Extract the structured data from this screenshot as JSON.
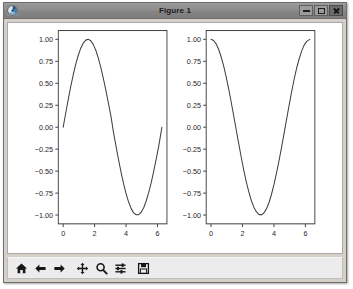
{
  "window": {
    "title": "Figure 1",
    "icon": "matplotlib-logo-icon",
    "buttons": {
      "minimize_label": "–",
      "maximize_label": "□",
      "close_label": "×",
      "minimize_name": "minimize",
      "maximize_name": "maximize",
      "close_name": "close"
    },
    "frame_color": "#d4d0c8",
    "titlebar_color": "#8a8a8a",
    "canvas_color": "#ffffff"
  },
  "toolbar": {
    "items": [
      {
        "name": "home-icon",
        "tooltip": "Reset original view"
      },
      {
        "name": "arrow-left-icon",
        "tooltip": "Back to previous view"
      },
      {
        "name": "arrow-right-icon",
        "tooltip": "Forward to next view"
      },
      {
        "name": "move-icon",
        "tooltip": "Pan axes with left mouse, zoom with right"
      },
      {
        "name": "magnifier-icon",
        "tooltip": "Zoom to rectangle"
      },
      {
        "name": "sliders-icon",
        "tooltip": "Configure subplots"
      },
      {
        "name": "floppy-disk-icon",
        "tooltip": "Save the figure"
      }
    ]
  },
  "chart_data": [
    {
      "type": "line",
      "title": "",
      "xlabel": "",
      "ylabel": "",
      "xlim": [
        -0.31,
        6.6
      ],
      "ylim": [
        -1.1,
        1.1
      ],
      "xticks": [
        0,
        2,
        4,
        6
      ],
      "xticklabels": [
        "0",
        "2",
        "4",
        "6"
      ],
      "yticks": [
        -1.0,
        -0.75,
        -0.5,
        -0.25,
        0.0,
        0.25,
        0.5,
        0.75,
        1.0
      ],
      "yticklabels": [
        "−1.00",
        "−0.75",
        "−0.50",
        "−0.25",
        "0.00",
        "0.25",
        "0.50",
        "0.75",
        "1.00"
      ],
      "grid": false,
      "legend": null,
      "series": [
        {
          "name": "sin(x)",
          "color": "#3b3b3b",
          "linewidth": 1.0,
          "x": [
            0.0,
            0.16,
            0.32,
            0.48,
            0.64,
            0.8,
            0.96,
            1.12,
            1.28,
            1.44,
            1.6,
            1.76,
            1.92,
            2.08,
            2.24,
            2.4,
            2.56,
            2.72,
            2.88,
            3.04,
            3.2,
            3.36,
            3.52,
            3.68,
            3.84,
            4.0,
            4.16,
            4.32,
            4.48,
            4.64,
            4.8,
            4.96,
            5.12,
            5.28,
            5.44,
            5.6,
            5.76,
            5.92,
            6.08,
            6.28
          ],
          "y": [
            0.0,
            0.159,
            0.315,
            0.462,
            0.597,
            0.717,
            0.819,
            0.9,
            0.958,
            0.991,
            1.0,
            0.983,
            0.94,
            0.873,
            0.783,
            0.675,
            0.551,
            0.415,
            0.271,
            0.123,
            -0.058,
            -0.216,
            -0.368,
            -0.511,
            -0.643,
            -0.757,
            -0.852,
            -0.924,
            -0.975,
            -0.997,
            -0.996,
            -0.968,
            -0.916,
            -0.84,
            -0.742,
            -0.631,
            -0.5,
            -0.358,
            -0.213,
            0.0
          ]
        }
      ]
    },
    {
      "type": "line",
      "title": "",
      "xlabel": "",
      "ylabel": "",
      "xlim": [
        -0.31,
        6.6
      ],
      "ylim": [
        -1.1,
        1.1
      ],
      "xticks": [
        0,
        2,
        4,
        6
      ],
      "xticklabels": [
        "0",
        "2",
        "4",
        "6"
      ],
      "yticks": [
        -1.0,
        -0.75,
        -0.5,
        -0.25,
        0.0,
        0.25,
        0.5,
        0.75,
        1.0
      ],
      "yticklabels": [
        "−1.00",
        "−0.75",
        "−0.50",
        "−0.25",
        "0.00",
        "0.25",
        "0.50",
        "0.75",
        "1.00"
      ],
      "grid": false,
      "legend": null,
      "series": [
        {
          "name": "cos(x)",
          "color": "#3b3b3b",
          "linewidth": 1.0,
          "x": [
            0.0,
            0.16,
            0.32,
            0.48,
            0.64,
            0.8,
            0.96,
            1.12,
            1.28,
            1.44,
            1.6,
            1.76,
            1.92,
            2.08,
            2.24,
            2.4,
            2.56,
            2.72,
            2.88,
            3.04,
            3.2,
            3.36,
            3.52,
            3.68,
            3.84,
            4.0,
            4.16,
            4.32,
            4.48,
            4.64,
            4.8,
            4.96,
            5.12,
            5.28,
            5.44,
            5.6,
            5.76,
            5.92,
            6.08,
            6.28
          ],
          "y": [
            1.0,
            0.987,
            0.949,
            0.887,
            0.802,
            0.697,
            0.574,
            0.436,
            0.287,
            0.13,
            -0.029,
            -0.188,
            -0.342,
            -0.488,
            -0.622,
            -0.737,
            -0.834,
            -0.91,
            -0.962,
            -0.992,
            -0.998,
            -0.976,
            -0.93,
            -0.86,
            -0.766,
            -0.654,
            -0.524,
            -0.383,
            -0.232,
            -0.073,
            0.087,
            0.246,
            0.399,
            0.543,
            0.671,
            0.776,
            0.866,
            0.934,
            0.977,
            1.0
          ]
        }
      ]
    }
  ]
}
